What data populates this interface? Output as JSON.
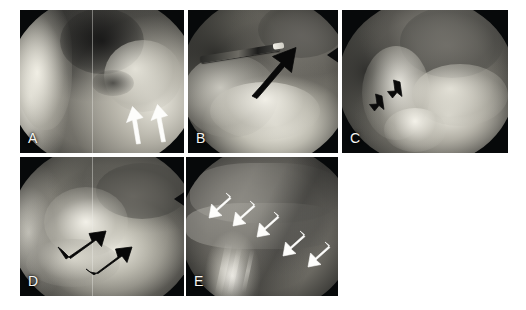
{
  "figure": {
    "kind": "arthroscopic-photomontage",
    "background_color": "#ffffff",
    "panel_background_color": "#07090a",
    "label_color": "#f4f4f2",
    "panel_count": 5,
    "rows": [
      [
        "A",
        "B",
        "C"
      ],
      [
        "D",
        "E"
      ]
    ]
  },
  "panels": [
    {
      "id": "A",
      "label": "A",
      "annotation_marker": "arrow",
      "annotation_color": "#ffffff",
      "annotation_count": 2,
      "annotation_direction": "up-left",
      "instrument_visible": false
    },
    {
      "id": "B",
      "label": "B",
      "annotation_marker": "arrow",
      "annotation_color": "#000000",
      "annotation_count": 1,
      "annotation_direction": "up-right",
      "instrument_visible": true
    },
    {
      "id": "C",
      "label": "C",
      "annotation_marker": "arrow",
      "annotation_color": "#000000",
      "annotation_count": 2,
      "annotation_direction": "down-left",
      "instrument_visible": false
    },
    {
      "id": "D",
      "label": "D",
      "annotation_marker": "arrow",
      "annotation_color": "#000000",
      "annotation_count": 2,
      "annotation_direction": "up-right",
      "instrument_visible": false
    },
    {
      "id": "E",
      "label": "E",
      "annotation_marker": "arrow",
      "annotation_color": "#ffffff",
      "annotation_count": 5,
      "annotation_direction": "down-left",
      "instrument_visible": false
    }
  ]
}
